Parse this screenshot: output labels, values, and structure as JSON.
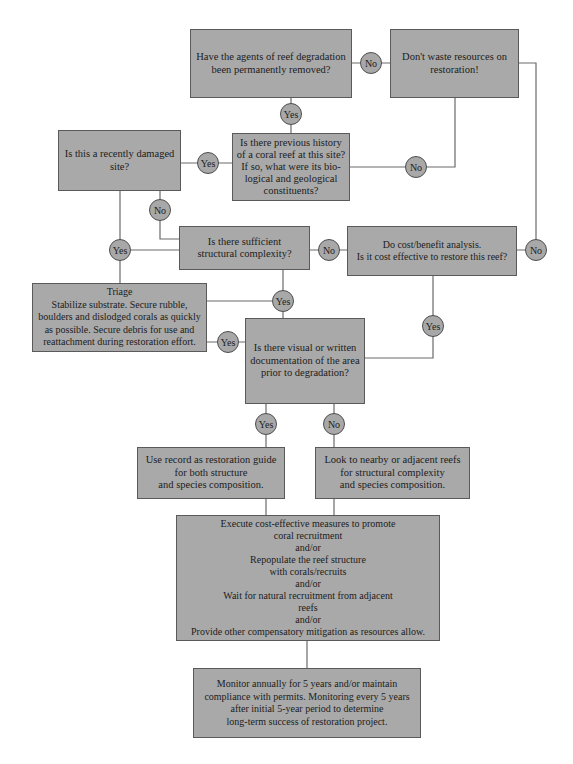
{
  "diagram": {
    "colors": {
      "box_fill": "#a9a9a9",
      "box_border": "#5a5a5a",
      "line": "#6a6a6a",
      "circle_fill": "#a8a8a8"
    },
    "nodes": {
      "agents_removed": "Have the agents of reef degradation\nbeen permanently removed?",
      "dont_waste": "Don't waste resources on\nrestoration!",
      "recently_damaged": "Is this a recently damaged\nsite?",
      "previous_history": "Is there previous history\nof a coral reef at this site?\nIf so, what were its bio-\nlogical and geological\nconstituents?",
      "structural_complexity": "Is there sufficient\nstructural complexity?",
      "cost_benefit": "Do cost/benefit analysis.\nIs it cost effective to restore this reef?",
      "triage": "Triage\nStabilize substrate. Secure rubble,\nboulders and dislodged corals as quickly\nas possible. Secure debris for use and\nreattachment during restoration effort.",
      "documentation": "Is there visual or  written\ndocumentation of the area\nprior to degradation?",
      "use_record": "Use record as restoration guide\nfor  both structure\nand species composition.",
      "look_nearby": "Look to nearby or adjacent reefs\nfor structural complexity\nand species composition.",
      "execute": "Execute cost-effective measures to promote\ncoral recruitment\nand/or\nRepopulate the reef structure\nwith corals/recruits\nand/or\nWait for natural recruitment from adjacent\nreefs\nand/or\nProvide other compensatory mitigation as resources allow.",
      "monitor": "Monitor annually for 5 years and/or maintain\ncompliance with permits. Monitoring every 5 years\nafter initial 5-year period to determine\nlong-term success of restoration project."
    },
    "labels": {
      "agents_no": "No",
      "agents_yes": "Yes",
      "damaged_yes": "Yes",
      "damaged_no": "No",
      "history_no": "No",
      "complexity_no": "No",
      "waste_no": "No",
      "triage_yes": "Yes",
      "complexity_yes": "Yes",
      "triage_doc_yes": "Yes",
      "cost_yes": "Yes",
      "doc_yes": "Yes",
      "doc_no": "No"
    }
  }
}
